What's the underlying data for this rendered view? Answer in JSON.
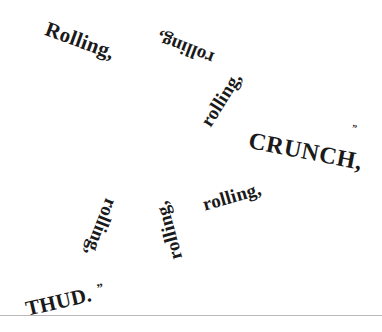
{
  "page": {
    "background_color": "#ffffff",
    "ink_color": "#1a1a1a",
    "rule_color": "#b9b9b9"
  },
  "sound_effects": [
    {
      "text": "Rolling,",
      "name": "sfx-rolling-1"
    },
    {
      "text": "rolling,",
      "name": "sfx-rolling-2"
    },
    {
      "text": "rolling,",
      "name": "sfx-rolling-3"
    },
    {
      "text": "CRUNCH,",
      "name": "sfx-crunch"
    },
    {
      "text": "rolling,",
      "name": "sfx-rolling-4"
    },
    {
      "text": "rolling,",
      "name": "sfx-rolling-5"
    },
    {
      "text": "rolling,",
      "name": "sfx-rolling-6"
    },
    {
      "text": "THUD.",
      "name": "sfx-thud"
    }
  ],
  "marks": {
    "crunch_quote": "”",
    "thud_quote": "”"
  }
}
